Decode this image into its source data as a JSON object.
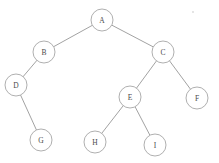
{
  "diagram": {
    "type": "binary-tree",
    "background_color": "#ffffff",
    "node_stroke_color": "#9a9a9a",
    "node_fill_color": "#ffffff",
    "edge_color": "#8a8a8a",
    "label_color": "#4a4a4a",
    "node_radius": 11,
    "width": 219,
    "height": 163,
    "nodes": [
      {
        "id": "A",
        "label": "A",
        "cx": 102,
        "cy": 20,
        "r": 11,
        "depth": 0
      },
      {
        "id": "B",
        "label": "B",
        "cx": 44,
        "cy": 52,
        "r": 11,
        "depth": 1
      },
      {
        "id": "C",
        "label": "C",
        "cx": 163,
        "cy": 52,
        "r": 11,
        "depth": 1
      },
      {
        "id": "D",
        "label": "D",
        "cx": 16,
        "cy": 85,
        "r": 11,
        "depth": 2
      },
      {
        "id": "E",
        "label": "E",
        "cx": 130,
        "cy": 97,
        "r": 11,
        "depth": 2
      },
      {
        "id": "F",
        "label": "F",
        "cx": 197,
        "cy": 98,
        "r": 11,
        "depth": 2
      },
      {
        "id": "G",
        "label": "G",
        "cx": 41,
        "cy": 140,
        "r": 11,
        "depth": 3
      },
      {
        "id": "H",
        "label": "H",
        "cx": 95,
        "cy": 142,
        "r": 11,
        "depth": 3
      },
      {
        "id": "I",
        "label": "I",
        "cx": 155,
        "cy": 145,
        "r": 11,
        "depth": 3
      }
    ],
    "edges": [
      {
        "from": "A",
        "to": "B",
        "side": "left"
      },
      {
        "from": "A",
        "to": "C",
        "side": "right"
      },
      {
        "from": "B",
        "to": "D",
        "side": "left"
      },
      {
        "from": "C",
        "to": "E",
        "side": "left"
      },
      {
        "from": "C",
        "to": "F",
        "side": "right"
      },
      {
        "from": "D",
        "to": "G",
        "side": "right"
      },
      {
        "from": "E",
        "to": "H",
        "side": "left"
      },
      {
        "from": "E",
        "to": "I",
        "side": "right"
      }
    ],
    "artifacts": [
      {
        "id": "speck",
        "cx": 193,
        "cy": 12,
        "r": 0.9
      }
    ]
  }
}
